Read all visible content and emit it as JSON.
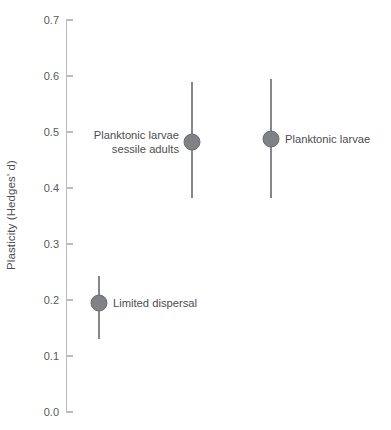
{
  "chart": {
    "type": "scatter",
    "title": "",
    "subtitle": "",
    "xlabel": "",
    "ylabel": "Plasticity (Hedges' d)",
    "ylim": [
      0.0,
      0.7
    ],
    "xlim": [
      0,
      4
    ],
    "grid": false,
    "legend": "none",
    "background_color": "#ffffff",
    "marker_color": "#808285",
    "marker_edge_color": "#6d6f72",
    "errorbar_color": "#85878a",
    "axis_color": "#b9bbbd",
    "text_color": "#4c4d4f",
    "y_ticks": [
      "0.0",
      "0.1",
      "0.2",
      "0.3",
      "0.4",
      "0.5",
      "0.6",
      "0.7"
    ],
    "y_tick_values": [
      0.0,
      0.1,
      0.2,
      0.3,
      0.4,
      0.5,
      0.6,
      0.7
    ]
  },
  "chart_data": {
    "type": "scatter",
    "title": "",
    "xlabel": "",
    "ylabel": "Plasticity (Hedges' d)",
    "ylim": [
      0.0,
      0.7
    ],
    "grid": false,
    "legend": "none",
    "yticks": [
      0.0,
      0.1,
      0.2,
      0.3,
      0.4,
      0.5,
      0.6,
      0.7
    ],
    "ytick_labels": [
      "0.0",
      "0.1",
      "0.2",
      "0.3",
      "0.4",
      "0.5",
      "0.6",
      "0.7"
    ],
    "categories": [
      "Limited dispersal",
      "Planktonic larvae\nsessile adults",
      "Planktonic larvae"
    ],
    "points": [
      {
        "label_line1": "Limited dispersal",
        "label_line2": "",
        "label_side": "right",
        "x_px": 99,
        "value": 0.195,
        "ci_low": 0.131,
        "ci_high": 0.243
      },
      {
        "label_line1": "Planktonic larvae",
        "label_line2": "sessile adults",
        "label_side": "left",
        "x_px": 192,
        "value": 0.483,
        "ci_low": 0.383,
        "ci_high": 0.589
      },
      {
        "label_line1": "Planktonic larvae",
        "label_line2": "",
        "label_side": "right",
        "x_px": 271,
        "value": 0.488,
        "ci_low": 0.383,
        "ci_high": 0.595
      }
    ],
    "values": [
      0.195,
      0.483,
      0.488
    ],
    "ci_low": [
      0.131,
      0.383,
      0.383
    ],
    "ci_high": [
      0.243,
      0.589,
      0.595
    ]
  }
}
